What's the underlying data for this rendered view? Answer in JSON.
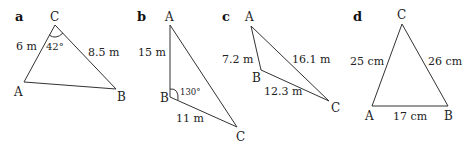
{
  "figures": [
    {
      "panel": "a",
      "vertices": {
        "A": "A",
        "B": "B",
        "C": "C"
      },
      "sides": {
        "AC": "6 m",
        "BC": "8.5 m"
      },
      "angle": {
        "at": "C",
        "value": "42°"
      }
    },
    {
      "panel": "b",
      "vertices": {
        "A": "A",
        "B": "B",
        "C": "C"
      },
      "sides": {
        "AB": "15 m",
        "BC": "11 m"
      },
      "angle": {
        "at": "B",
        "value": "130°"
      }
    },
    {
      "panel": "c",
      "vertices": {
        "A": "A",
        "B": "B",
        "C": "C"
      },
      "sides": {
        "AB": "7.2 m",
        "AC": "16.1 m",
        "BC": "12.3 m"
      }
    },
    {
      "panel": "d",
      "vertices": {
        "A": "A",
        "B": "B",
        "C": "C"
      },
      "sides": {
        "AC": "25 cm",
        "BC": "26 cm",
        "AB": "17 cm"
      }
    }
  ]
}
